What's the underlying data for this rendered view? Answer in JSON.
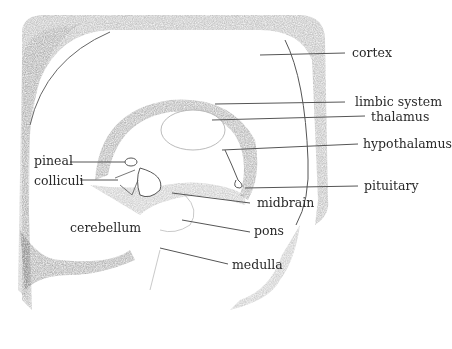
{
  "figure": {
    "type": "pencil sketch",
    "labels": [
      {
        "id": "cortex",
        "text": "cortex",
        "x": 352,
        "y": 47
      },
      {
        "id": "limbic-system",
        "text": "limbic system",
        "x": 355,
        "y": 96
      },
      {
        "id": "thalamus",
        "text": "thalamus",
        "x": 371,
        "y": 111
      },
      {
        "id": "hypothalamus",
        "text": "hypothalamus",
        "x": 363,
        "y": 138
      },
      {
        "id": "pineal",
        "text": "pineal",
        "x": 34,
        "y": 155
      },
      {
        "id": "colliculi",
        "text": "colliculi",
        "x": 34,
        "y": 175
      },
      {
        "id": "pituitary",
        "text": "pituitary",
        "x": 364,
        "y": 180
      },
      {
        "id": "midbrain",
        "text": "midbrain",
        "x": 257,
        "y": 197
      },
      {
        "id": "cerebellum",
        "text": "cerebellum",
        "x": 70,
        "y": 222
      },
      {
        "id": "pons",
        "text": "pons",
        "x": 254,
        "y": 225
      },
      {
        "id": "medulla",
        "text": "medulla",
        "x": 232,
        "y": 259
      }
    ],
    "caption_partial": "(text cut off at bottom edge)"
  }
}
